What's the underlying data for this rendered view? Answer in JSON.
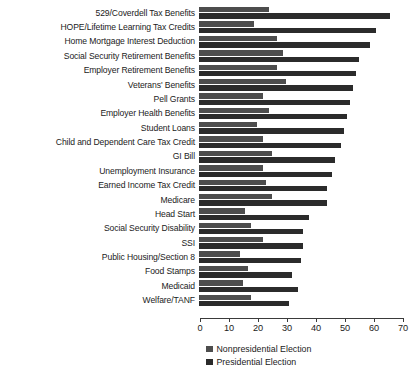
{
  "chart_data": {
    "type": "bar",
    "orientation": "horizontal",
    "title": "",
    "xlabel": "",
    "ylabel": "",
    "xlim": [
      0,
      70
    ],
    "xticks": [
      0,
      10,
      20,
      30,
      40,
      50,
      60,
      70
    ],
    "grid": false,
    "legend_position": "bottom",
    "categories": [
      "529/Coverdell Tax Benefits",
      "HOPE/Lifetime Learning Tax Credits",
      "Home Mortgage Interest Deduction",
      "Social Security Retirement Benefits",
      "Employer Retirement Benefits",
      "Veterans' Benefits",
      "Pell Grants",
      "Employer Health Benefits",
      "Student Loans",
      "Child and Dependent Care Tax Credit",
      "GI Bill",
      "Unemployment Insurance",
      "Earned Income Tax Credit",
      "Medicare",
      "Head Start",
      "Social Security Disability",
      "SSI",
      "Public Housing/Section 8",
      "Food Stamps",
      "Medicaid",
      "Welfare/TANF"
    ],
    "series": [
      {
        "name": "Nonpresidential Election",
        "color": "#4d4d4d",
        "values": [
          24,
          19,
          27,
          29,
          27,
          30,
          22,
          24,
          20,
          22,
          25,
          22,
          23,
          25,
          16,
          18,
          22,
          14,
          17,
          15,
          18
        ]
      },
      {
        "name": "Presidential Election",
        "color": "#2b2b2b",
        "values": [
          66,
          61,
          59,
          55,
          54,
          53,
          52,
          51,
          50,
          49,
          47,
          46,
          44,
          44,
          38,
          36,
          36,
          35,
          32,
          34,
          31
        ]
      }
    ]
  },
  "legend": {
    "items": [
      {
        "label": "Nonpresidential Election",
        "swatch": "nonpres"
      },
      {
        "label": "Presidential Election",
        "swatch": "pres"
      }
    ]
  }
}
